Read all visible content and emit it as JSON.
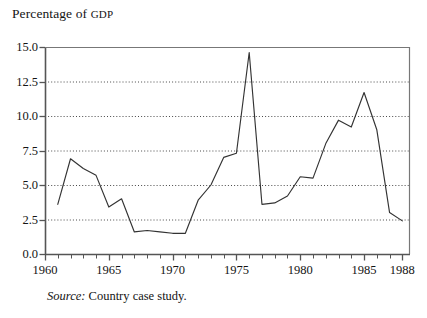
{
  "figure": {
    "axis_title_main": "Percentage of ",
    "axis_title_smallcaps": "GDP",
    "source_label": "Source:",
    "source_text": " Country case study."
  },
  "chart_data": {
    "type": "line",
    "title": "Percentage of GDP",
    "xlabel": "",
    "ylabel": "Percentage of GDP",
    "xlim": [
      1960,
      1988.6
    ],
    "ylim": [
      0.0,
      15.0
    ],
    "grid": true,
    "grid_axis": "y",
    "legend": false,
    "line_color": "#333333",
    "x": [
      1961,
      1962,
      1963,
      1964,
      1965,
      1966,
      1967,
      1968,
      1969,
      1970,
      1971,
      1972,
      1973,
      1974,
      1975,
      1976,
      1977,
      1978,
      1979,
      1980,
      1981,
      1982,
      1983,
      1984,
      1985,
      1986,
      1987,
      1988
    ],
    "values": [
      3.6,
      6.9,
      6.2,
      5.7,
      3.4,
      4.0,
      1.6,
      1.7,
      1.6,
      1.5,
      1.5,
      3.9,
      5.0,
      7.0,
      7.3,
      14.6,
      3.6,
      3.7,
      4.2,
      5.6,
      5.5,
      8.0,
      9.7,
      9.2,
      11.7,
      9.0,
      3.0,
      2.4
    ],
    "series": [
      {
        "name": "Percentage of GDP",
        "points": [
          {
            "x": 1961,
            "y": 3.6
          },
          {
            "x": 1962,
            "y": 6.9
          },
          {
            "x": 1963,
            "y": 6.2
          },
          {
            "x": 1964,
            "y": 5.7
          },
          {
            "x": 1965,
            "y": 3.4
          },
          {
            "x": 1966,
            "y": 4.0
          },
          {
            "x": 1967,
            "y": 1.6
          },
          {
            "x": 1968,
            "y": 1.7
          },
          {
            "x": 1969,
            "y": 1.6
          },
          {
            "x": 1970,
            "y": 1.5
          },
          {
            "x": 1971,
            "y": 1.5
          },
          {
            "x": 1972,
            "y": 3.9
          },
          {
            "x": 1973,
            "y": 5.0
          },
          {
            "x": 1974,
            "y": 7.0
          },
          {
            "x": 1975,
            "y": 7.3
          },
          {
            "x": 1976,
            "y": 14.6
          },
          {
            "x": 1977,
            "y": 3.6
          },
          {
            "x": 1978,
            "y": 3.7
          },
          {
            "x": 1979,
            "y": 4.2
          },
          {
            "x": 1980,
            "y": 5.6
          },
          {
            "x": 1981,
            "y": 5.5
          },
          {
            "x": 1982,
            "y": 8.0
          },
          {
            "x": 1983,
            "y": 9.7
          },
          {
            "x": 1984,
            "y": 9.2
          },
          {
            "x": 1985,
            "y": 11.7
          },
          {
            "x": 1986,
            "y": 9.0
          },
          {
            "x": 1987,
            "y": 3.0
          },
          {
            "x": 1988,
            "y": 2.4
          }
        ]
      }
    ],
    "ytick_labels": [
      "0.0",
      "2.5",
      "5.0",
      "7.5",
      "10.0",
      "12.5",
      "15.0"
    ],
    "ytick_values": [
      0.0,
      2.5,
      5.0,
      7.5,
      10.0,
      12.5,
      15.0
    ],
    "xtick_labels": [
      "1960",
      "1965",
      "1970",
      "1975",
      "1980",
      "1985",
      "1988"
    ],
    "xtick_values": [
      1960,
      1965,
      1970,
      1975,
      1980,
      1985,
      1988
    ],
    "xtick_minor_step": 1
  }
}
